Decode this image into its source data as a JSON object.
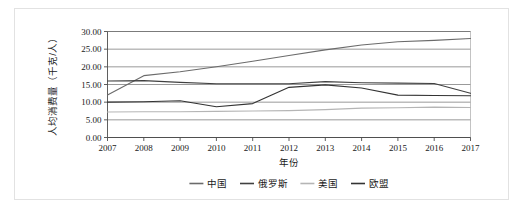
{
  "chart_data": {
    "type": "line",
    "title": "",
    "xlabel": "年份",
    "ylabel": "人均消费量（千克/人）",
    "x": [
      2007,
      2008,
      2009,
      2010,
      2011,
      2012,
      2013,
      2014,
      2015,
      2016,
      2017
    ],
    "xtick_labels": [
      "2007",
      "2008",
      "2009",
      "2010",
      "2011",
      "2012",
      "2013",
      "2014",
      "2015",
      "2016",
      "2017"
    ],
    "ytick_labels": [
      "0.00",
      "5.00",
      "10.00",
      "15.00",
      "20.00",
      "25.00",
      "30.00"
    ],
    "yticks": [
      0,
      5,
      10,
      15,
      20,
      25,
      30
    ],
    "ylim": [
      0,
      30
    ],
    "xlim": [
      2007,
      2017
    ],
    "grid": "horizontal",
    "legend_position": "bottom",
    "series": [
      {
        "name": "中国",
        "color": "#6b6b6b",
        "values": [
          12.0,
          17.5,
          18.6,
          20.0,
          21.6,
          23.2,
          24.8,
          26.2,
          27.1,
          27.5,
          28.0
        ]
      },
      {
        "name": "俄罗斯",
        "color": "#404040",
        "values": [
          16.0,
          16.1,
          15.6,
          15.2,
          15.2,
          15.2,
          15.8,
          15.5,
          15.4,
          15.3,
          12.5
        ]
      },
      {
        "name": "美国",
        "color": "#b5b5b5",
        "values": [
          7.2,
          7.3,
          7.3,
          7.4,
          7.5,
          7.6,
          7.9,
          8.3,
          8.4,
          8.6,
          8.5
        ]
      },
      {
        "name": "欧盟",
        "color": "#333333",
        "values": [
          10.0,
          10.1,
          10.4,
          8.7,
          9.6,
          14.2,
          14.9,
          14.0,
          12.0,
          11.9,
          11.8
        ]
      }
    ]
  },
  "legend": {
    "items": [
      {
        "label": "中国",
        "color": "#6b6b6b"
      },
      {
        "label": "俄罗斯",
        "color": "#404040"
      },
      {
        "label": "美国",
        "color": "#b5b5b5"
      },
      {
        "label": "欧盟",
        "color": "#333333"
      }
    ]
  }
}
